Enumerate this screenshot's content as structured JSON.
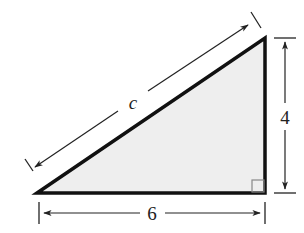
{
  "figure": {
    "type": "right-triangle",
    "colors": {
      "fill": "#eeeeee",
      "stroke": "#111111",
      "dimension": "#222222",
      "right_angle_marker": "#888888"
    },
    "vertices": {
      "bottom_left": [
        37,
        193
      ],
      "top_right": [
        265,
        38
      ],
      "bottom_right": [
        265,
        193
      ]
    },
    "labels": {
      "hypotenuse": "c",
      "vertical_leg": "4",
      "horizontal_leg": "6"
    },
    "right_angle": "bottom-right"
  }
}
